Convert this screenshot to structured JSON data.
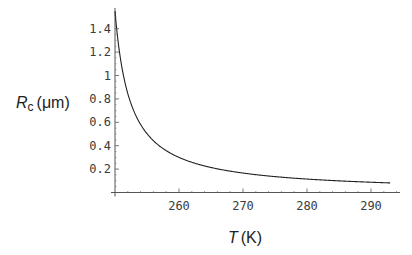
{
  "chart_data": {
    "type": "line",
    "title": "",
    "xlabel": "T (K)",
    "xlabel_var": "T",
    "xlabel_unit": "(K)",
    "ylabel": "R_c (μm)",
    "ylabel_var": "R",
    "ylabel_sub": "c",
    "ylabel_unit": "(μm)",
    "xlim": [
      250,
      295
    ],
    "ylim": [
      0,
      1.55
    ],
    "grid": false,
    "x_ticks": [
      260,
      270,
      280,
      290
    ],
    "y_ticks": [
      0.2,
      0.4,
      0.6,
      0.8,
      1,
      1.2,
      1.4
    ],
    "y_tick_labels": [
      "0.2",
      "0.4",
      "0.6",
      "0.8",
      "1",
      "1.2",
      "1.4"
    ],
    "series": [
      {
        "name": "R_c",
        "x": [
          250,
          252,
          254,
          256,
          258,
          260,
          262,
          264,
          266,
          268,
          270,
          272,
          274,
          276,
          278,
          280,
          282,
          284,
          286,
          288,
          290,
          292,
          293
        ],
        "values": [
          1.55,
          0.85,
          0.58,
          0.44,
          0.36,
          0.3,
          0.26,
          0.227,
          0.202,
          0.182,
          0.166,
          0.152,
          0.141,
          0.131,
          0.122,
          0.115,
          0.108,
          0.102,
          0.097,
          0.092,
          0.088,
          0.084,
          0.082
        ]
      }
    ]
  }
}
